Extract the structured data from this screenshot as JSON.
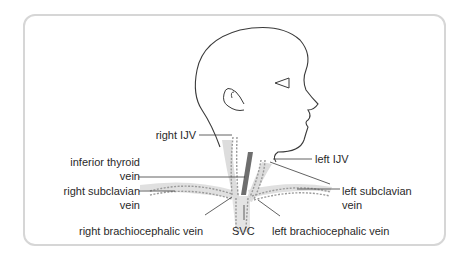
{
  "diagram": {
    "colors": {
      "frame": "#d6d6d6",
      "outline": "#3a3a3a",
      "vein_shade": "#dcdcdc",
      "dashed_vein": "#9a9a9a",
      "thyroid_vein": "#6e6e6e",
      "label_text": "#2a2a2a"
    },
    "labels": {
      "right_ijv": "right IJV",
      "left_ijv": "left IJV",
      "inferior_thyroid_1": "inferior thyroid",
      "inferior_thyroid_2": "vein",
      "right_subclavian_1": "right subclavian",
      "right_subclavian_2": "vein",
      "left_subclavian_1": "left subclavian",
      "left_subclavian_2": "vein",
      "right_brachiocephalic": "right brachiocephalic vein",
      "svc": "SVC",
      "left_brachiocephalic": "left brachiocephalic vein"
    }
  }
}
